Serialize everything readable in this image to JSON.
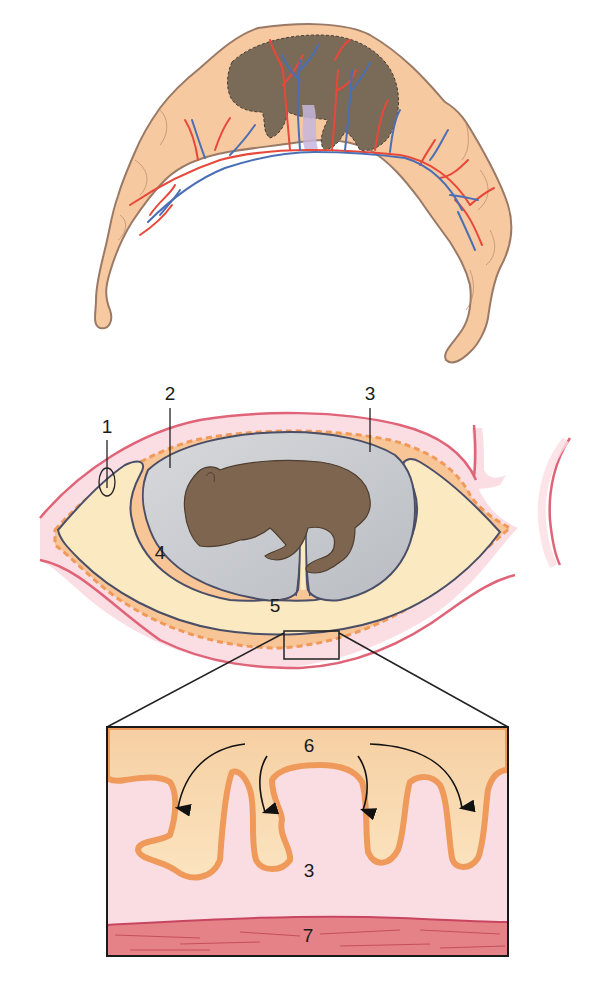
{
  "figure": {
    "panels": [
      {
        "id": "top",
        "description": "Diffuse placenta: chorion with branching blood vessels surrounding fetus"
      },
      {
        "id": "middle",
        "description": "Cross-section of fetal membranes within uterus"
      },
      {
        "id": "inset",
        "description": "Magnified view of chorionic villi interdigitating with endometrium"
      }
    ],
    "labels": {
      "l1": "1",
      "l2": "2",
      "l3": "3",
      "l4": "4",
      "l5": "5",
      "l6": "6",
      "l3b": "3",
      "l7": "7"
    },
    "colors": {
      "chorion_fill": "#f6c9a0",
      "chorion_stroke": "#9a7a66",
      "fetus": "#7a6450",
      "artery": "#e8483a",
      "vein": "#4a6fb5",
      "endometrium": "#f9dbe2",
      "uterine_line": "#e66a7a",
      "villus": "#f0a062",
      "allantois": "#fbe9c2",
      "amnion": "#c8cbd0",
      "myometrium": "#e07a80"
    }
  }
}
